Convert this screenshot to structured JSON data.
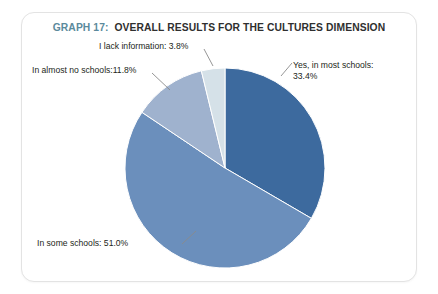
{
  "card": {
    "title_prefix": "GRAPH 17:",
    "title_main": "OVERALL RESULTS FOR THE CULTURES DIMENSION",
    "background": "#ffffff",
    "border_color": "#e3e3e3",
    "title_prefix_color": "#5b8a9c",
    "title_main_color": "#2f2f2f"
  },
  "labels": {
    "lack_information": "I lack information: 3.8%",
    "almost_no_schools": "In almost no schools:11.8%",
    "most_schools_line1": "Yes, in most schools:",
    "most_schools_line2": "33.4%",
    "some_schools": "In some schools: 51.0%"
  },
  "chart_data": {
    "type": "pie",
    "xlabel": "",
    "ylabel": "",
    "legend": "none",
    "grid": false,
    "start_angle_deg": 0,
    "direction": "clockwise",
    "center": {
      "x": 225,
      "y": 168
    },
    "radius": 100,
    "categories": [
      "Yes, in most schools",
      "In some schools",
      "In almost no schools",
      "I lack information"
    ],
    "values": [
      33.4,
      51.0,
      11.8,
      3.8
    ],
    "value_labels": [
      "33.4%",
      "51.0%",
      "11.8%",
      "3.8%"
    ],
    "colors": [
      "#3d6a9e",
      "#6b8fbc",
      "#9fb2ce",
      "#d5e1e8"
    ],
    "units": "percent",
    "total": 100.0
  },
  "leader_lines": {
    "color": "#8a8a8a",
    "lines": [
      {
        "name": "leader-lack-information",
        "x1": 204,
        "y1": 49,
        "x2": 213,
        "y2": 66
      },
      {
        "name": "leader-almost-no-schools",
        "x1": 152,
        "y1": 73,
        "x2": 170,
        "y2": 90
      },
      {
        "name": "leader-most-schools",
        "x1": 281,
        "y1": 76,
        "x2": 292,
        "y2": 63
      },
      {
        "name": "leader-some-schools",
        "x1": 182,
        "y1": 244,
        "x2": 196,
        "y2": 231
      }
    ]
  }
}
